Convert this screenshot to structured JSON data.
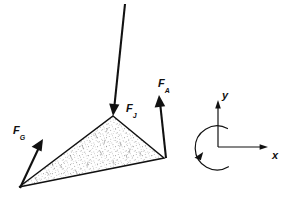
{
  "figure": {
    "background_color": "#ffffff",
    "ink_color": "#111111",
    "stipple_color": "#6f6f6f",
    "width": 290,
    "height": 201
  },
  "body": {
    "name": "wedge",
    "shape": "triangle",
    "fill": "stippled",
    "vertices": [
      {
        "id": "apex",
        "x": 113,
        "y": 116
      },
      {
        "id": "left",
        "x": 19,
        "y": 187
      },
      {
        "id": "right",
        "x": 164,
        "y": 158
      }
    ]
  },
  "forces": [
    {
      "id": "load",
      "label_base": "F",
      "label_sub": "J",
      "direction": "down",
      "tail": {
        "x": 125,
        "y": 4
      },
      "head": {
        "x": 113,
        "y": 114
      },
      "label_pos": {
        "x": 127,
        "y": 103
      }
    },
    {
      "id": "reaction-a",
      "label_base": "F",
      "label_sub": "A",
      "direction": "up",
      "tail": {
        "x": 166,
        "y": 158
      },
      "head": {
        "x": 159,
        "y": 95
      },
      "label_pos": {
        "x": 159,
        "y": 78
      }
    },
    {
      "id": "reaction-g",
      "label_base": "F",
      "label_sub": "G",
      "direction": "up-right",
      "tail": {
        "x": 20,
        "y": 188
      },
      "head": {
        "x": 43,
        "y": 139
      },
      "label_pos": {
        "x": 14,
        "y": 125
      }
    }
  ],
  "axes": {
    "origin": {
      "x": 218,
      "y": 147
    },
    "x_axis": {
      "label": "x",
      "from": {
        "x": 218,
        "y": 147
      },
      "to": {
        "x": 268,
        "y": 147
      },
      "label_pos": {
        "x": 273,
        "y": 149
      }
    },
    "y_axis": {
      "label": "y",
      "from": {
        "x": 218,
        "y": 147
      },
      "to": {
        "x": 218,
        "y": 101
      },
      "label_pos": {
        "x": 223,
        "y": 96
      }
    },
    "moment_arc": {
      "label": "moment",
      "direction": "counterclockwise",
      "center": {
        "x": 218,
        "y": 147
      },
      "radius": 22
    }
  }
}
